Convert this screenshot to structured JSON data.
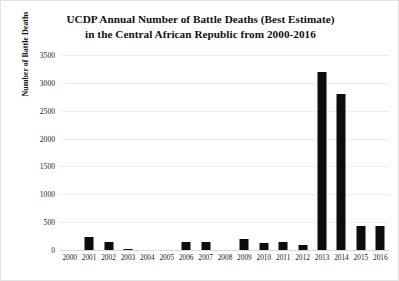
{
  "chart_data": {
    "type": "bar",
    "title": "UCDP Annual Number of Battle Deaths (Best Estimate) in the Central African Republic from 2000-2016",
    "title_lines": [
      "UCDP Annual Number of Battle Deaths (Best Estimate)",
      "in the Central African Republic from 2000-2016"
    ],
    "xlabel": "",
    "ylabel": "Number of Battle Deaths",
    "categories": [
      "2000",
      "2001",
      "2002",
      "2003",
      "2004",
      "2005",
      "2006",
      "2007",
      "2008",
      "2009",
      "2010",
      "2011",
      "2012",
      "2013",
      "2014",
      "2015",
      "2016"
    ],
    "values": [
      0,
      230,
      150,
      20,
      0,
      0,
      150,
      150,
      0,
      200,
      130,
      140,
      90,
      3200,
      2800,
      440,
      440
    ],
    "ylim": [
      0,
      3500
    ],
    "ytick_values": [
      0,
      500,
      1000,
      1500,
      2000,
      2500,
      3000,
      3500
    ],
    "ytick_labels": [
      "0",
      "500",
      "1000",
      "1500",
      "2000",
      "2500",
      "3000",
      "3500"
    ],
    "grid": true,
    "legend": false,
    "legend_position": "none",
    "bar_color": "#0d0d0d",
    "gridline_color": "#ededed",
    "background_color": "#ffffff"
  }
}
